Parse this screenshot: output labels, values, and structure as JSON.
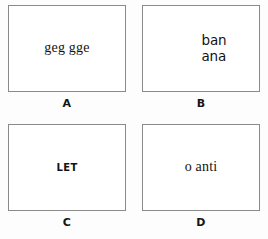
{
  "figure": {
    "type": "panel-grid",
    "columns": 2,
    "rows": 2,
    "border_color": "#8a8a8a",
    "background_color": "#ffffff",
    "text_color": "#121212"
  },
  "panels": [
    {
      "id": "A",
      "label": "A",
      "text": "geg  gge",
      "style": "serif-single-line"
    },
    {
      "id": "B",
      "label": "B",
      "text": "ban\nana",
      "style": "sans-two-lines"
    },
    {
      "id": "C",
      "label": "C",
      "text": "LET",
      "style": "bold-condensed-small-caps"
    },
    {
      "id": "D",
      "label": "D",
      "text": "o  anti",
      "style": "serif-single-line"
    }
  ]
}
